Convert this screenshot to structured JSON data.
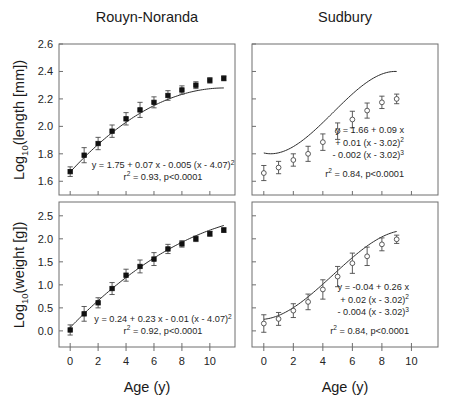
{
  "figure": {
    "xlabel": "Age (y)",
    "panels": [
      {
        "id": "rouyn-length",
        "title": "Rouyn-Noranda",
        "ylabel_parts": {
          "base": "Log",
          "sub": "10",
          "rest": "(length [mm])"
        },
        "ylabel": "Log10(length [mm])",
        "marker": "filled",
        "equation_lines": [
          {
            "text": "y = 1.75 + 0.07 x - 0.005 (x - 4.07)",
            "sup": "2"
          },
          {
            "text": "r",
            "sup": "2",
            "tail": " = 0.93, p<0.0001"
          }
        ],
        "chart_data": {
          "type": "scatter",
          "title": "Rouyn-Noranda",
          "xlabel": "Age (y)",
          "ylabel": "Log10(length [mm])",
          "xlim": [
            -0.8,
            11.8
          ],
          "ylim": [
            1.5,
            2.6
          ],
          "xticks": [
            0,
            2,
            4,
            6,
            8,
            10
          ],
          "yticks": [
            1.6,
            1.8,
            2.0,
            2.2,
            2.4,
            2.6
          ],
          "ytick_labels": [
            "1.6",
            "1.8",
            "2.0",
            "2.2",
            "2.4",
            "2.6"
          ],
          "grid": false,
          "legend": "none",
          "x": [
            0,
            1,
            2,
            3,
            4,
            5,
            6,
            7,
            8,
            9,
            10,
            11
          ],
          "y": [
            1.67,
            1.79,
            1.875,
            1.965,
            2.055,
            2.12,
            2.175,
            2.225,
            2.265,
            2.3,
            2.335,
            2.35
          ],
          "yerr": [
            0.035,
            0.055,
            0.045,
            0.045,
            0.045,
            0.055,
            0.04,
            0.035,
            0.03,
            0.025,
            0.02,
            0.018
          ],
          "fit": {
            "form": "y = 1.75 + 0.07 x - 0.005 (x - 4.07)^2",
            "a": 1.75,
            "b": 0.07,
            "c": -0.005,
            "x0": 4.07,
            "r2": 0.93,
            "p": "<0.0001"
          }
        }
      },
      {
        "id": "sudbury-length",
        "title": "Sudbury",
        "ylabel_parts": null,
        "ylabel": "",
        "marker": "open",
        "equation_lines": [
          {
            "text": "y = 1.66 + 0.09 x"
          },
          {
            "text": "+ 0.01 (x - 3.02)",
            "sup": "2"
          },
          {
            "text": "- 0.002 (x - 3.02)",
            "sup": "3"
          },
          {
            "text": "r",
            "sup": "2",
            "tail": " = 0.84, p<0.0001"
          }
        ],
        "chart_data": {
          "type": "scatter",
          "title": "Sudbury",
          "xlabel": "Age (y)",
          "ylabel": "Log10(length [mm])",
          "xlim": [
            -0.8,
            11.8
          ],
          "ylim": [
            1.5,
            2.6
          ],
          "xticks": [
            0,
            2,
            4,
            6,
            8,
            10
          ],
          "yticks": [
            1.6,
            1.8,
            2.0,
            2.2,
            2.4,
            2.6
          ],
          "ytick_labels": [],
          "grid": false,
          "legend": "none",
          "x": [
            0,
            1,
            2,
            3,
            4,
            5,
            6,
            7,
            8,
            9
          ],
          "y": [
            1.66,
            1.7,
            1.755,
            1.8,
            1.885,
            1.965,
            2.05,
            2.115,
            2.175,
            2.2
          ],
          "yerr": [
            0.055,
            0.045,
            0.045,
            0.055,
            0.06,
            0.06,
            0.06,
            0.055,
            0.045,
            0.035
          ],
          "fit": {
            "form": "y = 1.66 + 0.09 x + 0.01 (x - 3.02)^2 - 0.002 (x - 3.02)^3",
            "a": 1.66,
            "b": 0.09,
            "c": 0.01,
            "d": -0.002,
            "x0": 3.02,
            "r2": 0.84,
            "p": "<0.0001"
          }
        }
      },
      {
        "id": "rouyn-weight",
        "title": "",
        "ylabel_parts": {
          "base": "Log",
          "sub": "10",
          "rest": "(weight [g])"
        },
        "ylabel": "Log10(weight [g])",
        "marker": "filled",
        "equation_lines": [
          {
            "text": "y = 0.24 + 0.23 x - 0.01 (x - 4.07)",
            "sup": "2"
          },
          {
            "text": "r",
            "sup": "2",
            "tail": " = 0.92, p<0.0001"
          }
        ],
        "chart_data": {
          "type": "scatter",
          "title": "Rouyn-Noranda",
          "xlabel": "Age (y)",
          "ylabel": "Log10(weight [g])",
          "xlim": [
            -0.8,
            11.8
          ],
          "ylim": [
            -0.35,
            2.8
          ],
          "xticks": [
            0,
            2,
            4,
            6,
            8,
            10
          ],
          "yticks": [
            0.0,
            0.5,
            1.0,
            1.5,
            2.0,
            2.5
          ],
          "ytick_labels": [
            "0.0",
            "0.5",
            "1.0",
            "1.5",
            "2.0",
            "2.5"
          ],
          "grid": false,
          "legend": "none",
          "x": [
            0,
            1,
            2,
            3,
            4,
            5,
            6,
            7,
            8,
            9,
            10,
            11
          ],
          "y": [
            0.02,
            0.37,
            0.61,
            0.92,
            1.21,
            1.4,
            1.56,
            1.78,
            1.89,
            2.0,
            2.11,
            2.19
          ],
          "yerr": [
            0.11,
            0.16,
            0.11,
            0.13,
            0.13,
            0.14,
            0.14,
            0.1,
            0.07,
            0.06,
            0.055,
            0.05
          ],
          "fit": {
            "form": "y = 0.24 + 0.23 x - 0.01 (x - 4.07)^2",
            "a": 0.24,
            "b": 0.23,
            "c": -0.01,
            "x0": 4.07,
            "r2": 0.92,
            "p": "<0.0001"
          }
        }
      },
      {
        "id": "sudbury-weight",
        "title": "",
        "ylabel_parts": null,
        "ylabel": "",
        "marker": "open",
        "equation_lines": [
          {
            "text": "y = -0.04 + 0.26 x"
          },
          {
            "text": "+  0.02 (x - 3.02)",
            "sup": "2"
          },
          {
            "text": "-  0.004 (x - 3.02)",
            "sup": "3"
          },
          {
            "text": "r",
            "sup": "2",
            "tail": " = 0.84, p<0.0001"
          }
        ],
        "chart_data": {
          "type": "scatter",
          "title": "Sudbury",
          "xlabel": "Age (y)",
          "ylabel": "Log10(weight [g])",
          "xlim": [
            -0.8,
            11.8
          ],
          "ylim": [
            -0.35,
            2.8
          ],
          "xticks": [
            0,
            2,
            4,
            6,
            8,
            10
          ],
          "yticks": [
            0.0,
            0.5,
            1.0,
            1.5,
            2.0,
            2.5
          ],
          "ytick_labels": [],
          "grid": false,
          "legend": "none",
          "x": [
            0,
            1,
            2,
            3,
            4,
            5,
            6,
            7,
            8,
            9
          ],
          "y": [
            0.16,
            0.26,
            0.44,
            0.63,
            0.9,
            1.18,
            1.47,
            1.62,
            1.88,
            1.99
          ],
          "yerr": [
            0.19,
            0.14,
            0.15,
            0.17,
            0.21,
            0.22,
            0.22,
            0.2,
            0.14,
            0.09
          ],
          "fit": {
            "form": "y = -0.04 + 0.26 x + 0.02 (x - 3.02)^2 - 0.004 (x - 3.02)^3",
            "a": -0.04,
            "b": 0.26,
            "c": 0.02,
            "d": -0.004,
            "x0": 3.02,
            "r2": 0.84,
            "p": "<0.0001"
          }
        }
      }
    ]
  },
  "chart_data": {
    "type": "scatter",
    "xlabel": "Age (y)",
    "panels": [
      {
        "panel": "Rouyn-Noranda length",
        "ylabel": "Log10(length [mm])",
        "x": [
          0,
          1,
          2,
          3,
          4,
          5,
          6,
          7,
          8,
          9,
          10,
          11
        ],
        "y": [
          1.67,
          1.79,
          1.875,
          1.965,
          2.055,
          2.12,
          2.175,
          2.225,
          2.265,
          2.3,
          2.335,
          2.35
        ],
        "yerr": [
          0.035,
          0.055,
          0.045,
          0.045,
          0.045,
          0.055,
          0.04,
          0.035,
          0.03,
          0.025,
          0.02,
          0.018
        ],
        "equation": "y = 1.75 + 0.07 x - 0.005 (x - 4.07)^2",
        "r2": 0.93,
        "p": "<0.0001",
        "ylim": [
          1.5,
          2.6
        ],
        "xlim": [
          -0.8,
          11.8
        ]
      },
      {
        "panel": "Sudbury length",
        "ylabel": "Log10(length [mm])",
        "x": [
          0,
          1,
          2,
          3,
          4,
          5,
          6,
          7,
          8,
          9
        ],
        "y": [
          1.66,
          1.7,
          1.755,
          1.8,
          1.885,
          1.965,
          2.05,
          2.115,
          2.175,
          2.2
        ],
        "yerr": [
          0.055,
          0.045,
          0.045,
          0.055,
          0.06,
          0.06,
          0.06,
          0.055,
          0.045,
          0.035
        ],
        "equation": "y = 1.66 + 0.09 x + 0.01 (x - 3.02)^2 - 0.002 (x - 3.02)^3",
        "r2": 0.84,
        "p": "<0.0001",
        "ylim": [
          1.5,
          2.6
        ],
        "xlim": [
          -0.8,
          11.8
        ]
      },
      {
        "panel": "Rouyn-Noranda weight",
        "ylabel": "Log10(weight [g])",
        "x": [
          0,
          1,
          2,
          3,
          4,
          5,
          6,
          7,
          8,
          9,
          10,
          11
        ],
        "y": [
          0.02,
          0.37,
          0.61,
          0.92,
          1.21,
          1.4,
          1.56,
          1.78,
          1.89,
          2.0,
          2.11,
          2.19
        ],
        "yerr": [
          0.11,
          0.16,
          0.11,
          0.13,
          0.13,
          0.14,
          0.14,
          0.1,
          0.07,
          0.06,
          0.055,
          0.05
        ],
        "equation": "y = 0.24 + 0.23 x - 0.01 (x - 4.07)^2",
        "r2": 0.92,
        "p": "<0.0001",
        "ylim": [
          -0.35,
          2.8
        ],
        "xlim": [
          -0.8,
          11.8
        ]
      },
      {
        "panel": "Sudbury weight",
        "ylabel": "Log10(weight [g])",
        "x": [
          0,
          1,
          2,
          3,
          4,
          5,
          6,
          7,
          8,
          9
        ],
        "y": [
          0.16,
          0.26,
          0.44,
          0.63,
          0.9,
          1.18,
          1.47,
          1.62,
          1.88,
          1.99
        ],
        "yerr": [
          0.19,
          0.14,
          0.15,
          0.17,
          0.21,
          0.22,
          0.22,
          0.2,
          0.14,
          0.09
        ],
        "equation": "y = -0.04 + 0.26 x + 0.02 (x - 3.02)^2 - 0.004 (x - 3.02)^3",
        "r2": 0.84,
        "p": "<0.0001",
        "ylim": [
          -0.35,
          2.8
        ],
        "xlim": [
          -0.8,
          11.8
        ]
      }
    ]
  }
}
